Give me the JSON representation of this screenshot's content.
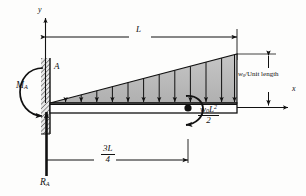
{
  "figure": {
    "type": "cantilever-beam-free-body-diagram"
  },
  "axes": {
    "y_label": "y",
    "x_label": "x"
  },
  "labels": {
    "span_L": "L",
    "point_A": "A",
    "moment_reaction": "M",
    "moment_reaction_sub": "A",
    "force_reaction": "R",
    "force_reaction_sub": "A",
    "load_intensity_w": "w",
    "load_intensity_sub": "0",
    "load_intensity_rest": "/Unit length",
    "applied_moment_num_w": "w",
    "applied_moment_num_sub": "0",
    "applied_moment_num_L": "L",
    "applied_moment_num_exp": "2",
    "applied_moment_den": "2",
    "distance_num": "3L",
    "distance_den": "4"
  },
  "colors": {
    "ink": "#111111",
    "load_fill": "#b9b9b9",
    "wall_hatch": "#8a8a8a",
    "beam_fill": "#ffffff",
    "background": "#fdfdfc"
  },
  "geometry": {
    "beam_left_x": 50,
    "beam_right_x": 237,
    "beam_top_y": 103,
    "beam_bottom_y": 113,
    "load_peak_height": 49,
    "load_arrow_count": 12,
    "applied_moment_x": 188,
    "span_dimension_y": 37,
    "distance_dimension_y": 160
  }
}
